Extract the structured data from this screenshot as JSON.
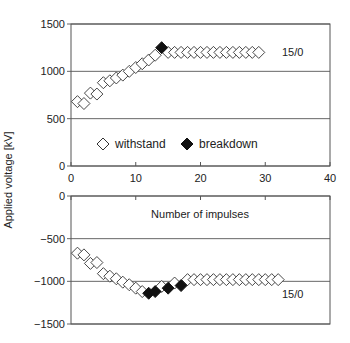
{
  "chart_data": [
    {
      "type": "scatter",
      "panel": "top",
      "title": "",
      "xlabel": "",
      "ylabel": "Applied voltage [kV]",
      "xlim": [
        0,
        40
      ],
      "ylim": [
        0,
        1500
      ],
      "xticks": [
        0,
        10,
        20,
        30,
        40
      ],
      "yticks": [
        0,
        500,
        1000,
        1500
      ],
      "grid": "horizontal",
      "annotation": "15/0",
      "legend": [
        {
          "label": "withstand",
          "marker": "open-diamond"
        },
        {
          "label": "breakdown",
          "marker": "filled-diamond"
        }
      ],
      "series": [
        {
          "name": "withstand",
          "x": [
            1,
            2,
            3,
            4,
            5,
            6,
            7,
            8,
            9,
            10,
            11,
            12,
            13,
            15,
            16,
            17,
            18,
            19,
            20,
            21,
            22,
            23,
            24,
            25,
            26,
            27,
            28,
            29
          ],
          "values": [
            680,
            660,
            770,
            760,
            880,
            900,
            930,
            960,
            1000,
            1040,
            1080,
            1120,
            1170,
            1200,
            1200,
            1200,
            1200,
            1200,
            1200,
            1200,
            1200,
            1200,
            1200,
            1200,
            1200,
            1200,
            1200,
            1200
          ]
        },
        {
          "name": "breakdown",
          "x": [
            14
          ],
          "values": [
            1250
          ]
        }
      ]
    },
    {
      "type": "scatter",
      "panel": "bottom",
      "title": "",
      "xlabel": "Number of impulses",
      "ylabel": "Applied voltage [kV]",
      "xlim": [
        0,
        40
      ],
      "ylim": [
        -1500,
        0
      ],
      "xticks": [
        0,
        10,
        20,
        30,
        40
      ],
      "yticks": [
        0,
        -500,
        -1000,
        -1500
      ],
      "grid": "horizontal",
      "annotation": "15/0",
      "series": [
        {
          "name": "withstand",
          "x": [
            1,
            2,
            3,
            4,
            5,
            6,
            7,
            8,
            9,
            10,
            11,
            14,
            16,
            18,
            19,
            20,
            21,
            22,
            23,
            24,
            25,
            26,
            27,
            28,
            29,
            30,
            31,
            32
          ],
          "values": [
            -670,
            -690,
            -790,
            -780,
            -910,
            -940,
            -970,
            -1010,
            -1040,
            -1080,
            -1120,
            -1060,
            -1020,
            -980,
            -980,
            -980,
            -980,
            -980,
            -980,
            -980,
            -980,
            -980,
            -980,
            -980,
            -980,
            -980,
            -980,
            -980
          ]
        },
        {
          "name": "breakdown",
          "x": [
            12,
            13,
            15,
            17
          ],
          "values": [
            -1140,
            -1120,
            -1080,
            -1050
          ]
        }
      ]
    }
  ],
  "labels": {
    "ylabel": "Applied voltage [kV]",
    "xlabel": "Number of impulses",
    "legend_withstand": "withstand",
    "legend_breakdown": "breakdown",
    "top_annotation": "15/0",
    "bottom_annotation": "15/0"
  },
  "colors": {
    "axis": "#555555",
    "marker_open_fill": "#ffffff",
    "marker_stroke": "#333333",
    "marker_filled": "#111111",
    "text": "#222222"
  }
}
